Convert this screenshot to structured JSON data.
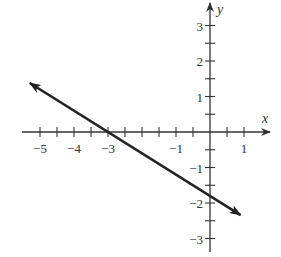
{
  "chart_data": {
    "type": "line",
    "title": "",
    "xlabel": "x",
    "ylabel": "y",
    "xlim": [
      -5.5,
      1.7
    ],
    "ylim": [
      -3.4,
      3.6
    ],
    "grid": false,
    "x_ticks": [
      -5,
      -4.5,
      -4,
      -3.5,
      -3,
      -2.5,
      -2,
      -1.5,
      -1,
      -0.5,
      0.5,
      1
    ],
    "x_tick_labels": [
      {
        "value": -5,
        "label": "−5"
      },
      {
        "value": -4,
        "label": "−4"
      },
      {
        "value": -3,
        "label": "−3"
      },
      {
        "value": -1,
        "label": "−1"
      },
      {
        "value": 1,
        "label": "1"
      }
    ],
    "y_ticks": [
      -3,
      -2.5,
      -2,
      -1.5,
      -1,
      -0.5,
      0.5,
      1,
      1.5,
      2,
      2.5,
      3
    ],
    "y_tick_labels": [
      {
        "value": 3,
        "label": "3"
      },
      {
        "value": 2,
        "label": "2"
      },
      {
        "value": 1,
        "label": "1"
      },
      {
        "value": -1,
        "label": "−1"
      },
      {
        "value": -2,
        "label": "−2"
      },
      {
        "value": -3,
        "label": "−3"
      }
    ],
    "series": [
      {
        "name": "line",
        "equation": "y = -0.6x - 1.8",
        "x_intercept": -3,
        "y_intercept": -1.8,
        "x": [
          -5.3,
          0.9
        ],
        "y": [
          1.38,
          -2.34
        ],
        "arrows_both_ends": true,
        "color": "#222222"
      }
    ]
  }
}
